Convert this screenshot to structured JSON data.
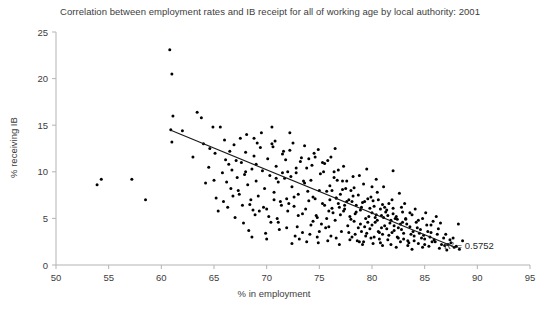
{
  "chart_data": {
    "type": "scatter",
    "title": "Correlation between employment rates and IB receipt for all of working age by local authority: 2001",
    "xlabel": "% in employment",
    "ylabel": "% receiving IB",
    "xlim": [
      50,
      95
    ],
    "ylim": [
      0,
      25
    ],
    "xticks": [
      50,
      55,
      60,
      65,
      70,
      75,
      80,
      85,
      90,
      95
    ],
    "yticks": [
      0,
      5,
      10,
      15,
      20,
      25
    ],
    "grid": false,
    "legend": null,
    "marker_color": "#000000",
    "marker_size": 3,
    "annotations": [
      {
        "text": "R² = 0.5752",
        "x": 89.2,
        "y": 1.75
      }
    ],
    "trendline": {
      "type": "linear",
      "x_start": 60.9,
      "y_start": 14.45,
      "x_end": 88.0,
      "y_end": 1.85,
      "color": "#1a1a1a",
      "r_squared": 0.5752
    },
    "points": [
      [
        53.9,
        8.6
      ],
      [
        54.3,
        9.2
      ],
      [
        57.2,
        9.2
      ],
      [
        58.5,
        7.0
      ],
      [
        60.8,
        23.1
      ],
      [
        61.0,
        20.5
      ],
      [
        61.1,
        16.0
      ],
      [
        60.9,
        14.5
      ],
      [
        61.0,
        13.2
      ],
      [
        62.0,
        14.4
      ],
      [
        63.4,
        16.4
      ],
      [
        63.8,
        15.8
      ],
      [
        64.9,
        14.8
      ],
      [
        65.6,
        14.8
      ],
      [
        66.0,
        13.4
      ],
      [
        63.0,
        11.6
      ],
      [
        64.6,
        12.5
      ],
      [
        64.5,
        10.5
      ],
      [
        65.0,
        9.1
      ],
      [
        65.2,
        7.2
      ],
      [
        65.4,
        5.8
      ],
      [
        66.1,
        11.3
      ],
      [
        66.4,
        10.8
      ],
      [
        66.7,
        10.2
      ],
      [
        66.9,
        12.9
      ],
      [
        67.2,
        9.4
      ],
      [
        67.4,
        7.6
      ],
      [
        67.6,
        11.0
      ],
      [
        67.9,
        9.7
      ],
      [
        68.0,
        12.1
      ],
      [
        68.2,
        8.6
      ],
      [
        68.4,
        6.5
      ],
      [
        68.6,
        10.3
      ],
      [
        68.8,
        11.7
      ],
      [
        69.0,
        9.0
      ],
      [
        69.2,
        7.4
      ],
      [
        69.4,
        12.6
      ],
      [
        69.6,
        10.1
      ],
      [
        69.8,
        8.2
      ],
      [
        70.0,
        6.0
      ],
      [
        70.1,
        11.4
      ],
      [
        70.3,
        9.6
      ],
      [
        70.5,
        13.0
      ],
      [
        70.7,
        7.8
      ],
      [
        70.9,
        10.6
      ],
      [
        71.1,
        8.9
      ],
      [
        71.3,
        6.8
      ],
      [
        71.5,
        11.9
      ],
      [
        71.7,
        9.3
      ],
      [
        71.9,
        7.1
      ],
      [
        72.0,
        10.0
      ],
      [
        72.2,
        12.3
      ],
      [
        72.4,
        8.4
      ],
      [
        72.6,
        6.3
      ],
      [
        72.8,
        9.9
      ],
      [
        73.0,
        7.6
      ],
      [
        73.2,
        11.1
      ],
      [
        73.4,
        5.5
      ],
      [
        73.6,
        8.8
      ],
      [
        73.8,
        10.4
      ],
      [
        74.0,
        6.9
      ],
      [
        74.2,
        9.1
      ],
      [
        74.4,
        7.3
      ],
      [
        74.6,
        11.6
      ],
      [
        74.8,
        5.1
      ],
      [
        75.0,
        8.0
      ],
      [
        75.1,
        9.8
      ],
      [
        75.3,
        6.6
      ],
      [
        75.5,
        10.9
      ],
      [
        75.7,
        7.9
      ],
      [
        75.9,
        5.8
      ],
      [
        76.0,
        8.5
      ],
      [
        76.2,
        6.1
      ],
      [
        76.4,
        9.4
      ],
      [
        76.6,
        7.2
      ],
      [
        76.8,
        10.2
      ],
      [
        77.0,
        5.4
      ],
      [
        77.2,
        8.1
      ],
      [
        77.4,
        6.4
      ],
      [
        77.6,
        9.0
      ],
      [
        77.8,
        7.0
      ],
      [
        78.0,
        4.9
      ],
      [
        78.1,
        6.8
      ],
      [
        78.3,
        8.3
      ],
      [
        78.5,
        5.7
      ],
      [
        78.7,
        7.5
      ],
      [
        78.9,
        4.4
      ],
      [
        79.0,
        6.2
      ],
      [
        79.2,
        8.7
      ],
      [
        79.4,
        5.0
      ],
      [
        79.6,
        7.1
      ],
      [
        79.8,
        3.9
      ],
      [
        80.0,
        5.6
      ],
      [
        80.1,
        6.9
      ],
      [
        80.3,
        4.6
      ],
      [
        80.5,
        7.8
      ],
      [
        80.7,
        3.5
      ],
      [
        80.9,
        5.3
      ],
      [
        81.0,
        6.5
      ],
      [
        81.2,
        4.2
      ],
      [
        81.4,
        5.9
      ],
      [
        81.6,
        3.2
      ],
      [
        81.8,
        4.8
      ],
      [
        82.0,
        6.1
      ],
      [
        82.1,
        3.7
      ],
      [
        82.3,
        5.2
      ],
      [
        82.5,
        2.9
      ],
      [
        82.7,
        4.4
      ],
      [
        82.9,
        5.7
      ],
      [
        83.0,
        3.4
      ],
      [
        83.2,
        4.9
      ],
      [
        83.4,
        2.6
      ],
      [
        83.6,
        4.1
      ],
      [
        83.8,
        5.4
      ],
      [
        84.0,
        3.1
      ],
      [
        84.2,
        4.6
      ],
      [
        84.4,
        2.3
      ],
      [
        84.6,
        3.8
      ],
      [
        84.8,
        5.0
      ],
      [
        85.0,
        2.8
      ],
      [
        85.2,
        4.3
      ],
      [
        85.4,
        2.0
      ],
      [
        85.6,
        3.5
      ],
      [
        85.8,
        4.7
      ],
      [
        86.0,
        2.5
      ],
      [
        86.3,
        3.9
      ],
      [
        86.6,
        2.2
      ],
      [
        87.0,
        3.3
      ],
      [
        87.4,
        2.7
      ],
      [
        87.8,
        1.9
      ],
      [
        88.2,
        4.4
      ],
      [
        87.1,
        1.6
      ],
      [
        82.0,
        10.1
      ],
      [
        86.5,
        4.5
      ],
      [
        66.3,
        6.2
      ],
      [
        67.0,
        5.1
      ],
      [
        68.9,
        5.4
      ],
      [
        70.4,
        4.6
      ],
      [
        71.2,
        3.8
      ],
      [
        72.9,
        4.1
      ],
      [
        74.1,
        3.3
      ],
      [
        75.6,
        4.0
      ],
      [
        76.1,
        3.1
      ],
      [
        77.1,
        3.6
      ],
      [
        78.6,
        2.6
      ],
      [
        79.9,
        2.9
      ],
      [
        73.1,
        2.8
      ],
      [
        74.9,
        2.4
      ],
      [
        76.9,
        2.2
      ],
      [
        80.8,
        2.4
      ],
      [
        69.5,
        14.2
      ],
      [
        70.8,
        13.3
      ],
      [
        72.5,
        13.1
      ],
      [
        71.6,
        12.2
      ],
      [
        73.3,
        11.5
      ],
      [
        74.5,
        12.0
      ],
      [
        75.8,
        11.2
      ],
      [
        76.5,
        12.5
      ],
      [
        77.3,
        10.6
      ],
      [
        78.8,
        9.6
      ],
      [
        79.5,
        10.3
      ],
      [
        80.4,
        9.2
      ],
      [
        81.1,
        8.4
      ],
      [
        82.6,
        7.7
      ],
      [
        83.1,
        6.6
      ],
      [
        84.1,
        6.0
      ],
      [
        85.1,
        5.6
      ],
      [
        86.1,
        5.2
      ],
      [
        67.8,
        4.5
      ],
      [
        68.3,
        3.7
      ],
      [
        69.9,
        3.4
      ],
      [
        71.0,
        5.0
      ],
      [
        72.1,
        6.6
      ],
      [
        73.7,
        6.0
      ],
      [
        74.7,
        5.3
      ],
      [
        75.2,
        4.4
      ],
      [
        76.3,
        5.6
      ],
      [
        77.7,
        4.2
      ],
      [
        78.4,
        3.3
      ],
      [
        79.3,
        4.1
      ],
      [
        80.6,
        3.6
      ],
      [
        81.5,
        2.7
      ],
      [
        82.4,
        3.0
      ],
      [
        83.5,
        2.4
      ],
      [
        84.5,
        3.4
      ],
      [
        85.5,
        3.0
      ],
      [
        86.8,
        2.9
      ],
      [
        64.2,
        8.8
      ],
      [
        65.8,
        9.9
      ],
      [
        66.6,
        8.2
      ],
      [
        67.5,
        13.6
      ],
      [
        68.1,
        14.0
      ],
      [
        69.1,
        13.1
      ],
      [
        70.6,
        12.7
      ],
      [
        71.8,
        11.3
      ],
      [
        72.3,
        9.5
      ],
      [
        73.5,
        9.0
      ],
      [
        74.3,
        10.7
      ],
      [
        75.4,
        10.0
      ],
      [
        76.7,
        9.1
      ],
      [
        77.5,
        8.2
      ],
      [
        78.2,
        7.4
      ],
      [
        79.1,
        6.7
      ],
      [
        80.2,
        6.3
      ],
      [
        81.3,
        5.7
      ],
      [
        82.2,
        5.0
      ],
      [
        83.3,
        4.4
      ],
      [
        84.3,
        4.0
      ],
      [
        85.3,
        3.6
      ],
      [
        78.9,
        5.9
      ],
      [
        79.7,
        5.2
      ],
      [
        80.0,
        4.3
      ],
      [
        80.9,
        4.0
      ],
      [
        81.7,
        4.5
      ],
      [
        82.8,
        3.8
      ],
      [
        79.4,
        3.1
      ],
      [
        78.7,
        4.0
      ],
      [
        77.9,
        5.2
      ],
      [
        77.4,
        6.0
      ],
      [
        76.8,
        6.6
      ],
      [
        76.0,
        7.0
      ],
      [
        80.3,
        5.1
      ],
      [
        81.0,
        3.3
      ],
      [
        81.9,
        3.5
      ],
      [
        83.0,
        2.8
      ],
      [
        84.0,
        2.6
      ],
      [
        85.0,
        2.2
      ],
      [
        79.0,
        3.6
      ],
      [
        79.6,
        4.6
      ],
      [
        80.5,
        4.8
      ],
      [
        81.1,
        5.1
      ],
      [
        78.3,
        4.7
      ],
      [
        77.8,
        3.5
      ],
      [
        78.1,
        3.0
      ],
      [
        79.2,
        2.5
      ],
      [
        80.7,
        2.8
      ],
      [
        81.4,
        3.9
      ],
      [
        82.1,
        4.2
      ],
      [
        82.9,
        4.6
      ],
      [
        76.5,
        4.8
      ],
      [
        75.9,
        4.1
      ],
      [
        75.0,
        3.6
      ],
      [
        74.2,
        4.3
      ],
      [
        73.4,
        3.5
      ],
      [
        72.7,
        3.1
      ],
      [
        71.9,
        4.0
      ],
      [
        71.1,
        4.6
      ],
      [
        70.2,
        5.2
      ],
      [
        69.3,
        5.8
      ],
      [
        68.5,
        7.0
      ],
      [
        67.7,
        6.4
      ],
      [
        66.8,
        7.4
      ],
      [
        65.9,
        6.8
      ],
      [
        65.1,
        12.0
      ],
      [
        64.0,
        13.0
      ],
      [
        83.7,
        3.3
      ],
      [
        84.7,
        2.9
      ],
      [
        85.7,
        2.5
      ],
      [
        86.9,
        2.1
      ],
      [
        87.5,
        2.4
      ],
      [
        88.0,
        2.0
      ],
      [
        77.0,
        7.6
      ],
      [
        77.6,
        6.8
      ],
      [
        78.5,
        6.4
      ],
      [
        79.8,
        6.1
      ],
      [
        80.4,
        5.4
      ],
      [
        81.2,
        6.2
      ],
      [
        82.0,
        5.5
      ],
      [
        82.5,
        4.0
      ],
      [
        83.9,
        3.6
      ],
      [
        84.9,
        3.2
      ],
      [
        72.6,
        7.3
      ],
      [
        73.9,
        7.9
      ],
      [
        74.6,
        7.1
      ],
      [
        75.5,
        6.4
      ],
      [
        76.2,
        8.0
      ],
      [
        76.6,
        7.2
      ],
      [
        75.7,
        5.0
      ],
      [
        74.4,
        4.7
      ],
      [
        73.0,
        5.3
      ],
      [
        72.0,
        5.8
      ],
      [
        71.4,
        6.4
      ],
      [
        70.7,
        7.0
      ],
      [
        69.7,
        6.2
      ],
      [
        68.7,
        5.9
      ],
      [
        67.3,
        8.0
      ],
      [
        66.2,
        8.9
      ],
      [
        79.9,
        7.3
      ],
      [
        80.6,
        7.0
      ],
      [
        81.6,
        6.6
      ],
      [
        78.0,
        8.0
      ],
      [
        77.2,
        9.0
      ],
      [
        76.4,
        10.0
      ],
      [
        75.3,
        11.0
      ],
      [
        74.0,
        11.4
      ],
      [
        73.6,
        12.8
      ],
      [
        72.8,
        10.4
      ],
      [
        71.5,
        9.9
      ],
      [
        70.9,
        9.3
      ],
      [
        69.0,
        10.8
      ],
      [
        68.0,
        10.0
      ],
      [
        81.8,
        2.2
      ],
      [
        82.7,
        2.5
      ],
      [
        83.4,
        2.1
      ],
      [
        86.2,
        3.3
      ],
      [
        85.9,
        2.7
      ],
      [
        87.2,
        2.2
      ],
      [
        86.4,
        1.8
      ],
      [
        84.8,
        1.9
      ],
      [
        83.8,
        1.7
      ],
      [
        82.3,
        1.9
      ],
      [
        81.0,
        2.1
      ],
      [
        80.1,
        2.3
      ],
      [
        79.1,
        2.2
      ],
      [
        78.8,
        2.5
      ],
      [
        77.9,
        2.7
      ],
      [
        76.6,
        2.9
      ],
      [
        75.8,
        2.6
      ],
      [
        74.8,
        3.0
      ],
      [
        73.8,
        2.5
      ],
      [
        72.4,
        2.3
      ],
      [
        70.0,
        2.8
      ],
      [
        68.6,
        3.0
      ],
      [
        79.5,
        3.4
      ],
      [
        80.2,
        3.0
      ],
      [
        78.4,
        5.5
      ],
      [
        77.3,
        5.8
      ],
      [
        76.9,
        6.2
      ],
      [
        79.3,
        6.8
      ],
      [
        80.8,
        6.0
      ],
      [
        81.5,
        5.3
      ],
      [
        82.4,
        4.9
      ],
      [
        83.2,
        5.0
      ],
      [
        84.4,
        4.8
      ],
      [
        85.6,
        4.3
      ],
      [
        83.6,
        5.6
      ],
      [
        82.8,
        6.2
      ],
      [
        81.9,
        7.0
      ],
      [
        80.0,
        8.4
      ],
      [
        78.2,
        9.5
      ],
      [
        76.1,
        11.6
      ],
      [
        74.9,
        12.4
      ],
      [
        72.2,
        14.2
      ],
      [
        70.5,
        14.8
      ],
      [
        68.8,
        13.6
      ],
      [
        67.1,
        11.2
      ],
      [
        66.5,
        12.2
      ],
      [
        88.3,
        1.7
      ],
      [
        87.7,
        2.9
      ],
      [
        88.6,
        2.6
      ]
    ]
  }
}
